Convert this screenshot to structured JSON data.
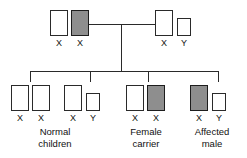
{
  "diagram": {
    "colors": {
      "stroke": "#2a2a2a",
      "shaded_fill": "#8e8e8e",
      "unshaded_fill": "#ffffff",
      "text": "#111111",
      "background": "#ffffff"
    },
    "generations": [
      {
        "name": "parents",
        "individuals": [
          {
            "id": "mother",
            "role": "carrier-mother",
            "chromosomes": [
              {
                "allele": "X",
                "shaded": false,
                "size": "large"
              },
              {
                "allele": "X",
                "shaded": true,
                "size": "large"
              }
            ],
            "genotype_labels": [
              "X",
              "X"
            ],
            "caption": ""
          },
          {
            "id": "father",
            "role": "normal-father",
            "chromosomes": [
              {
                "allele": "X",
                "shaded": false,
                "size": "large"
              },
              {
                "allele": "Y",
                "shaded": false,
                "size": "small"
              }
            ],
            "genotype_labels": [
              "X",
              "Y"
            ],
            "caption": ""
          }
        ]
      },
      {
        "name": "offspring",
        "individuals": [
          {
            "id": "child-1",
            "role": "normal-daughter",
            "chromosomes": [
              {
                "allele": "X",
                "shaded": false,
                "size": "large"
              },
              {
                "allele": "X",
                "shaded": false,
                "size": "large"
              }
            ],
            "genotype_labels": [
              "X",
              "X"
            ],
            "caption": {
              "line1": "Normal",
              "line2": "children"
            }
          },
          {
            "id": "child-2",
            "role": "normal-son",
            "chromosomes": [
              {
                "allele": "X",
                "shaded": false,
                "size": "large"
              },
              {
                "allele": "Y",
                "shaded": false,
                "size": "small"
              }
            ],
            "genotype_labels": [
              "X",
              "Y"
            ],
            "caption": ""
          },
          {
            "id": "child-3",
            "role": "carrier-daughter",
            "chromosomes": [
              {
                "allele": "X",
                "shaded": false,
                "size": "large"
              },
              {
                "allele": "X",
                "shaded": true,
                "size": "large"
              }
            ],
            "genotype_labels": [
              "X",
              "X"
            ],
            "caption": {
              "line1": "Female",
              "line2": "carrier"
            }
          },
          {
            "id": "child-4",
            "role": "affected-son",
            "chromosomes": [
              {
                "allele": "X",
                "shaded": true,
                "size": "large"
              },
              {
                "allele": "Y",
                "shaded": false,
                "size": "small"
              }
            ],
            "genotype_labels": [
              "X",
              "Y"
            ],
            "caption": {
              "line1": "Affected",
              "line2": "male"
            }
          }
        ]
      }
    ],
    "alleles": {
      "mother_x1": "X",
      "mother_x2": "X",
      "father_x": "X",
      "father_y": "Y",
      "c1_x1": "X",
      "c1_x2": "X",
      "c2_x": "X",
      "c2_y": "Y",
      "c3_x1": "X",
      "c3_x2": "X",
      "c4_x": "X",
      "c4_y": "Y"
    },
    "captions": {
      "normal_children_line1": "Normal",
      "normal_children_line2": "children",
      "female_carrier_line1": "Female",
      "female_carrier_line2": "carrier",
      "affected_male_line1": "Affected",
      "affected_male_line2": "male"
    }
  }
}
